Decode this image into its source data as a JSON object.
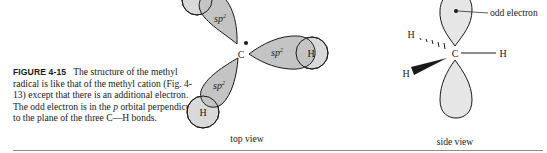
{
  "caption": {
    "figure_label": "FIGURE 4-15",
    "text_part1": "The structure of the methyl radical is like that of the methyl cation (Fig. 4-13) except that there is an additional electron. The odd electron is in the ",
    "italic_p": "p",
    "text_part2": " orbital perpendicular to the plane of the three C—H bonds."
  },
  "top_view": {
    "label": "top view",
    "center_atom": "C",
    "lobe_label": "sp",
    "lobe_superscript": "2",
    "hydrogen_label": "H",
    "lobe_fill": "#c4c4c4",
    "hydrogen_fill": "#d9d9d9"
  },
  "side_view": {
    "label": "side view",
    "center_atom": "C",
    "hydrogen_dashed": "H",
    "hydrogen_plain": "H",
    "hydrogen_wedge": "H",
    "annotation": "odd electron",
    "lobe_fill": "#e6e6e6"
  },
  "colors": {
    "stroke": "#1a1a1a",
    "rule": "#8a8a8a"
  }
}
